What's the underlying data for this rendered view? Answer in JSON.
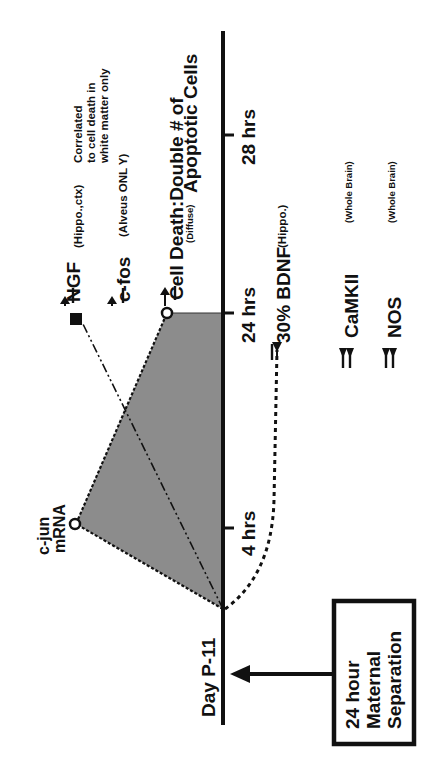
{
  "diagram": {
    "orientation": "rotated -90deg (timeline reads bottom-to-top)",
    "colors": {
      "ink": "#111111",
      "shaded_region": "#8c8c8c",
      "background": "#ffffff"
    },
    "timeline": {
      "start_label": "Day P-11",
      "ticks": [
        {
          "label": "4 hrs",
          "hours": 4
        },
        {
          "label": "24 hrs",
          "hours": 24
        },
        {
          "label": "28 hrs",
          "hours": 28
        }
      ]
    },
    "event_box": {
      "line1": "24 hour",
      "line2": "Maternal",
      "line3": "Separation"
    },
    "cjun": {
      "line1": "c-jun",
      "line2": "mRNA"
    },
    "ngf": {
      "label": "NGF",
      "region": "(Hippo.,ctx)",
      "note_line1": "Correlated",
      "note_line2": "to cell death in",
      "note_line3": "white matter only"
    },
    "cfos": {
      "label": "c-fos",
      "region": "(Alveus ONL Y)"
    },
    "cell_death": {
      "line1": "Cell Death:Double # of",
      "sub": "(Diffuse)",
      "line2": "Apoptotic Cells"
    },
    "bdnf": {
      "label": "30% BDNF",
      "region": "(Hippo.)"
    },
    "camkii": {
      "label": "CaMKII",
      "region": "(Whole Brain)"
    },
    "nos": {
      "label": "NOS",
      "region": "(Whole Brain)"
    }
  }
}
